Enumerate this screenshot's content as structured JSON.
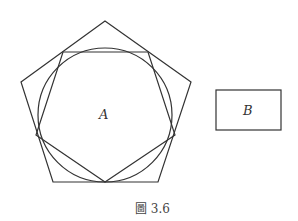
{
  "figure": {
    "caption": "圖 3.6",
    "stroke_color": "#333333",
    "shapes": {
      "outer_pentagon": "105,21 191,82 158,182 53,182 21,82",
      "inscribed_circle": {
        "cx": 105,
        "cy": 115,
        "r": 67
      },
      "inner_polygon": "63,52 148,52 175,135 105,182 36,135",
      "rectangle_b": {
        "x": 216,
        "y": 90,
        "width": 65,
        "height": 40
      }
    },
    "labels": {
      "a": "A",
      "b": "B"
    }
  }
}
